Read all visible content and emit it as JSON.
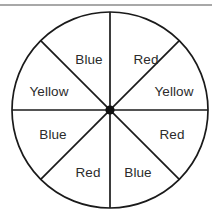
{
  "figure": {
    "name": "spinner-wheel",
    "type": "probability-spinner",
    "background_color": "#ffffff",
    "top_rule": {
      "visible": true,
      "color": "#a8a8a8",
      "y": 4,
      "thickness": 2
    },
    "circle": {
      "center_x": 110,
      "center_y": 110,
      "radius": 98,
      "stroke_color": "#1a1a1a",
      "stroke_width": 1.7,
      "fill_color": "#ffffff"
    },
    "hub": {
      "center_x": 110,
      "center_y": 110,
      "radius": 4.6,
      "color": "#111111"
    },
    "divider_lines": [
      {
        "name": "vertical-divider",
        "angle_deg": 90
      },
      {
        "name": "horizontal-divider",
        "angle_deg": 0
      },
      {
        "name": "diagonal-divider-nw-se",
        "angle_deg": 45
      },
      {
        "name": "diagonal-divider-ne-sw",
        "angle_deg": 135
      }
    ],
    "sector_count": 8,
    "sectors": [
      {
        "index": 0,
        "label": "Red",
        "position": "top-right",
        "center_angle_deg": 67.5,
        "label_x": 146,
        "label_y": 60
      },
      {
        "index": 1,
        "label": "Yellow",
        "position": "right-upper",
        "center_angle_deg": 22.5,
        "label_y": 92,
        "label_x": 174
      },
      {
        "index": 2,
        "label": "Red",
        "position": "right-lower",
        "center_angle_deg": -22.5,
        "label_x": 172,
        "label_y": 135
      },
      {
        "index": 3,
        "label": "Blue",
        "position": "bottom-right",
        "center_angle_deg": -67.5,
        "label_x": 138,
        "label_y": 173
      },
      {
        "index": 4,
        "label": "Red",
        "position": "bottom-left",
        "center_angle_deg": 247.5,
        "label_x": 88,
        "label_y": 173
      },
      {
        "index": 5,
        "label": "Blue",
        "position": "left-lower",
        "center_angle_deg": 202.5,
        "label_x": 53,
        "label_y": 135
      },
      {
        "index": 6,
        "label": "Yellow",
        "position": "left-upper",
        "center_angle_deg": 157.5,
        "label_x": 49,
        "label_y": 92
      },
      {
        "index": 7,
        "label": "Blue",
        "position": "top-left",
        "center_angle_deg": 112.5,
        "label_x": 89,
        "label_y": 60
      }
    ],
    "label_style": {
      "font_size": 13.5,
      "color": "#2b2b2b"
    }
  }
}
